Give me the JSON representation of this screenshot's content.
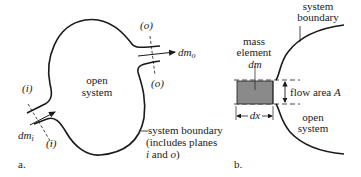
{
  "figure_a": {
    "caption": "a.",
    "region_label_line1": "open",
    "region_label_line2": "system",
    "inlet_plane_top": "(i)",
    "inlet_plane_bottom": "(i)",
    "outlet_plane_top": "(o)",
    "outlet_plane_bottom": "(o)",
    "inlet_mass": "dm",
    "inlet_mass_sub": "i",
    "outlet_mass": "dm",
    "outlet_mass_sub": "o",
    "boundary_line1": "system boundary",
    "boundary_line2": "(includes planes",
    "boundary_line3_i": "i",
    "boundary_line3_and": " and ",
    "boundary_line3_o": "o",
    "boundary_line3_close": ")"
  },
  "figure_b": {
    "caption": "b.",
    "boundary_line1": "system",
    "boundary_line2": "boundary",
    "mass_line1": "mass",
    "mass_line2": "element",
    "mass_symbol": "dm",
    "flow_area": "flow area ",
    "flow_area_symbol": "A",
    "dx": "dx",
    "region_line1": "open",
    "region_line2": "system"
  },
  "colors": {
    "line": "#1a1a1a",
    "shade": "#8a8a8a"
  }
}
